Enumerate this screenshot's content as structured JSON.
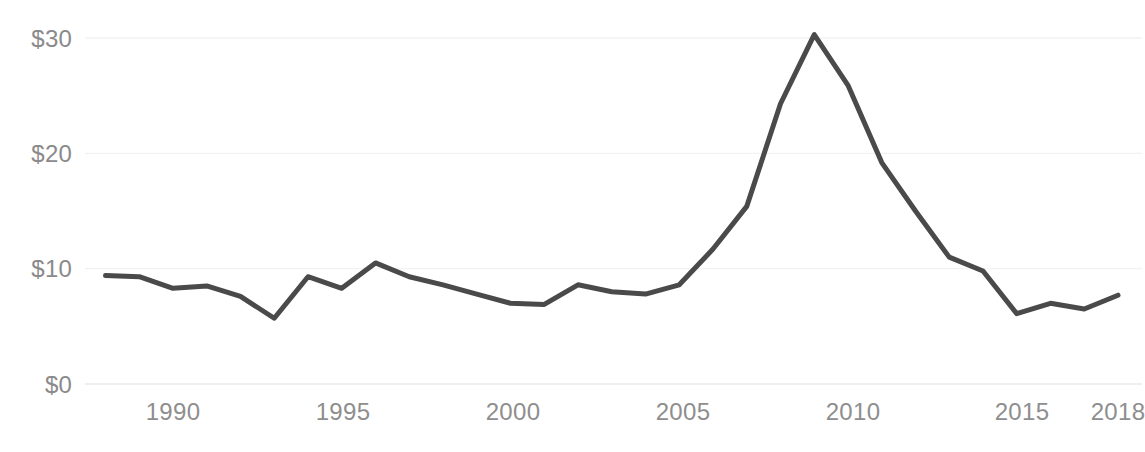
{
  "chart_data": {
    "type": "line",
    "title": "",
    "subtitle": "",
    "xlabel": "",
    "ylabel": "",
    "xlim": [
      1988,
      2018
    ],
    "ylim": [
      0,
      33
    ],
    "grid": true,
    "grid_axis": "y",
    "legend": null,
    "legend_position": "none",
    "y_tick_labels": [
      "$30",
      "$20",
      "$10",
      "$0"
    ],
    "y_tick_values": [
      30,
      20,
      10,
      0
    ],
    "x_tick_labels": [
      "1990",
      "1995",
      "2000",
      "2005",
      "2010",
      "2015",
      "2018"
    ],
    "x_tick_values": [
      1990,
      1995,
      2000,
      2005,
      2010,
      2015,
      2018
    ],
    "series": [
      {
        "name": "value",
        "color": "#4a4a4a",
        "line_width": 5,
        "x": [
          1988,
          1989,
          1990,
          1991,
          1992,
          1993,
          1994,
          1995,
          1996,
          1997,
          1998,
          1999,
          2000,
          2001,
          2002,
          2003,
          2004,
          2005,
          2006,
          2007,
          2008,
          2009,
          2010,
          2011,
          2012,
          2013,
          2014,
          2015,
          2016,
          2017,
          2018
        ],
        "values": [
          9.4,
          9.3,
          8.3,
          8.5,
          7.6,
          5.7,
          9.3,
          8.3,
          10.5,
          9.3,
          8.6,
          7.8,
          7.0,
          6.9,
          8.6,
          8.0,
          7.8,
          8.6,
          11.7,
          15.4,
          24.3,
          30.3,
          25.9,
          19.2,
          15.0,
          11.0,
          9.8,
          6.1,
          7.0,
          6.5,
          7.7
        ]
      }
    ]
  },
  "axis": {
    "baseline_color": "#e8e8e8",
    "gridline_color": "#f2f2f2",
    "tick_text_color": "#8e8e8e"
  },
  "colors": {
    "background": "#ffffff",
    "line": "#4a4a4a",
    "tick_label": "#8a8a8a"
  },
  "overlay": {
    "clipped_header_text": ""
  }
}
